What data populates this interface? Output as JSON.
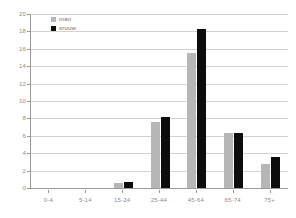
{
  "chart_data": {
    "type": "bar",
    "title": "",
    "subtitle": "",
    "xlabel": "",
    "ylabel": "",
    "categories": [
      "0-4",
      "5-14",
      "15-24",
      "25-44",
      "45-64",
      "65-74",
      "75+"
    ],
    "series": [
      {
        "name": "man",
        "color": "#b6b6b6",
        "values": [
          0,
          0,
          0.6,
          7.6,
          15.5,
          6.3,
          2.8
        ]
      },
      {
        "name": "srouw",
        "color": "#0d0d0d",
        "values": [
          0,
          0,
          0.7,
          8.2,
          18.3,
          6.3,
          3.6
        ]
      }
    ],
    "ylim": [
      0,
      20
    ],
    "yticks": [
      0,
      2,
      4,
      6,
      8,
      10,
      12,
      14,
      16,
      18,
      20
    ],
    "ytick_labels": [
      "0",
      "2",
      "4",
      "6",
      "8",
      "10",
      "12",
      "14",
      "16",
      "18",
      "20"
    ],
    "grid": "horizontal",
    "legend_position": "top-left-inside",
    "axis_color": "#9a9a9a",
    "grid_color": "#d2d2d2",
    "tick_label_color": "#8d8d8d",
    "background": "#ffffff"
  }
}
